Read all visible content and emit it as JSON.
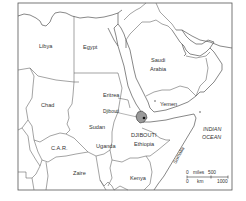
{
  "map": {
    "countries": [
      {
        "id": "libya",
        "label": "Libya",
        "x": 39,
        "y": 48
      },
      {
        "id": "egypt",
        "label": "Egypt",
        "x": 83,
        "y": 49
      },
      {
        "id": "saudi-arabia-1",
        "label": "Saudi",
        "x": 151,
        "y": 62
      },
      {
        "id": "saudi-arabia-2",
        "label": "Arabia",
        "x": 150,
        "y": 71
      },
      {
        "id": "chad",
        "label": "Chad",
        "x": 41,
        "y": 107
      },
      {
        "id": "eritrea",
        "label": "Eritrea",
        "x": 103,
        "y": 97
      },
      {
        "id": "djibouti-small",
        "label": "Djibouti",
        "x": 103,
        "y": 113
      },
      {
        "id": "yemen",
        "label": "Yemen",
        "x": 160,
        "y": 106
      },
      {
        "id": "sudan",
        "label": "Sudan",
        "x": 89,
        "y": 129
      },
      {
        "id": "djibouti-caps",
        "label": "DJIBOUTI",
        "x": 131,
        "y": 137
      },
      {
        "id": "ethiopia",
        "label": "Ethiopia",
        "x": 134,
        "y": 146
      },
      {
        "id": "car",
        "label": "C.A.R.",
        "x": 51,
        "y": 150
      },
      {
        "id": "uganda",
        "label": "Uganda",
        "x": 96,
        "y": 148
      },
      {
        "id": "zaire",
        "label": "Zaire",
        "x": 73,
        "y": 175
      },
      {
        "id": "kenya",
        "label": "Kenya",
        "x": 130,
        "y": 180
      }
    ],
    "rotated_labels": [
      {
        "id": "somalia",
        "label": "Somalia",
        "x": 175,
        "y": 155,
        "angle": -62
      }
    ],
    "ocean": {
      "line1": "INDIAN",
      "line2": "OCEAN"
    },
    "highlight_country": "Djibouti",
    "highlight_color": "#9a9a9a",
    "scale": {
      "top_zero": "0",
      "top_unit": "miles",
      "top_max": "500",
      "bottom_zero": "0",
      "bottom_unit": "km",
      "bottom_max": "1000"
    }
  }
}
